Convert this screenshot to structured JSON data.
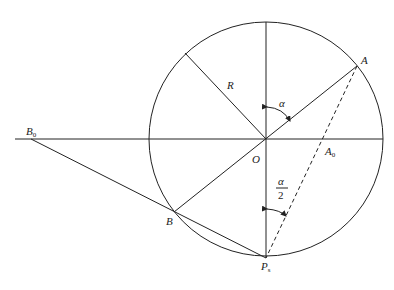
{
  "diagram": {
    "type": "geometry",
    "circle": {
      "center": "O",
      "radius_label": "R"
    },
    "points": {
      "A": {
        "label": "A"
      },
      "A0": {
        "label": "A",
        "subscript": "0"
      },
      "B": {
        "label": "B"
      },
      "B0": {
        "label": "B",
        "subscript": "0"
      },
      "O": {
        "label": "O"
      },
      "Ps": {
        "label": "P",
        "subscript": "s"
      }
    },
    "angles": {
      "alpha": {
        "label": "α"
      },
      "half_alpha": {
        "numerator": "α",
        "denominator": "2"
      }
    },
    "radius_label": "R"
  }
}
